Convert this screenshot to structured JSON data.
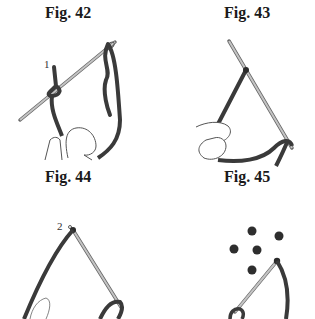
{
  "figures": [
    {
      "caption": "Fig. 42",
      "label": "1"
    },
    {
      "caption": "Fig. 43",
      "label": ""
    },
    {
      "caption": "Fig. 44",
      "label": "2"
    },
    {
      "caption": "Fig. 45",
      "label": ""
    }
  ],
  "colors": {
    "thread": "#3a3a3a",
    "needle": "#a8a8a8",
    "outline": "#555555",
    "background": "#ffffff"
  }
}
